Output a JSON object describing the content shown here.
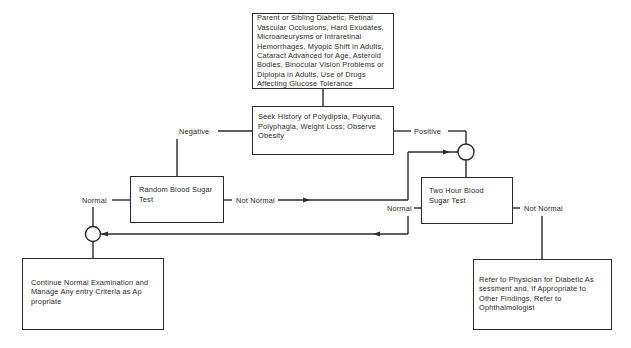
{
  "nodes": {
    "risk_factors": "Parent or Sibling Diabetic, Retinal Vascular Occlusions, Hard Exudates, Microaneurysms or Intraretinal Hemorrhages, Myopic Shift in Adults, Cataract Advanced for Age, Asteroid Bodies, Binocular Vision Problems or Diplopia in Adults, Use of Drugs Affecting Glucose Tolerance",
    "history": "Seek History of Polydipsia, Polyuria, Polyphagia, Weight Loss; Observe Obesity",
    "random_test": "Random Blood Sugar Test",
    "two_hour_test": "Two Hour Blood Sugar Test",
    "continue_exam": "Continue Normal Examination and Manage Any entry Criteria as Ap propriate",
    "refer": "Refer to Physician for Diabetic As sessment and, If Appropriate to Other Findings, Refer to Ophthalmologist"
  },
  "edges": {
    "negative": "Negative",
    "positive": "Positive",
    "random_normal": "Normal",
    "random_not_normal": "Not Normal",
    "two_hour_normal": "Normal",
    "two_hour_not_normal": "Not Normal"
  }
}
